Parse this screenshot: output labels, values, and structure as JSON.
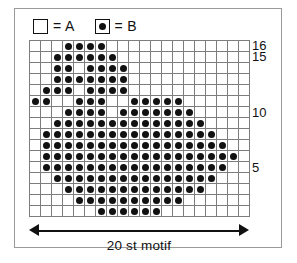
{
  "legend": {
    "items": [
      {
        "icon": "empty-square-swatch",
        "filled": false,
        "text": "= A"
      },
      {
        "icon": "dotted-square-swatch",
        "filled": true,
        "text": "= B"
      }
    ]
  },
  "chart_data": {
    "type": "heatmap",
    "title": "",
    "xlabel": "20 st motif",
    "ylabel": "",
    "columns": 20,
    "rows": 16,
    "grid_on": true,
    "legend_position": "top-left",
    "symbols": {
      "A": "empty",
      "B": "dot"
    },
    "row_tick_labels": [
      "16",
      "15",
      "10",
      "5"
    ],
    "row_tick_rows": [
      16,
      15,
      10,
      5
    ],
    "row_numbering": "bottom-to-top",
    "note": "rows listed top(16) to bottom(1); each row is 20 columns left-to-right, 0 = A (empty), 1 = B (dot)",
    "values": [
      [
        0,
        0,
        0,
        1,
        1,
        1,
        1,
        0,
        0,
        0,
        0,
        0,
        0,
        0,
        0,
        0,
        0,
        0,
        0,
        0
      ],
      [
        0,
        0,
        1,
        1,
        1,
        1,
        1,
        1,
        0,
        0,
        0,
        0,
        0,
        0,
        0,
        0,
        0,
        0,
        0,
        0
      ],
      [
        0,
        0,
        1,
        1,
        0,
        1,
        1,
        1,
        1,
        0,
        0,
        0,
        0,
        0,
        0,
        0,
        0,
        0,
        0,
        0
      ],
      [
        0,
        0,
        1,
        1,
        1,
        1,
        1,
        1,
        1,
        0,
        0,
        0,
        0,
        0,
        0,
        0,
        0,
        0,
        0,
        0
      ],
      [
        0,
        1,
        1,
        1,
        0,
        1,
        1,
        1,
        1,
        0,
        0,
        0,
        0,
        0,
        0,
        0,
        0,
        0,
        0,
        0
      ],
      [
        1,
        1,
        0,
        0,
        1,
        1,
        1,
        0,
        0,
        1,
        1,
        1,
        1,
        1,
        0,
        0,
        0,
        0,
        0,
        0
      ],
      [
        0,
        0,
        0,
        1,
        1,
        1,
        1,
        0,
        1,
        1,
        1,
        1,
        1,
        1,
        1,
        0,
        0,
        0,
        0,
        0
      ],
      [
        0,
        0,
        1,
        1,
        1,
        1,
        1,
        1,
        1,
        1,
        1,
        1,
        1,
        1,
        1,
        1,
        0,
        0,
        0,
        0
      ],
      [
        0,
        1,
        1,
        1,
        1,
        1,
        1,
        1,
        1,
        1,
        1,
        1,
        1,
        1,
        1,
        1,
        1,
        0,
        0,
        0
      ],
      [
        0,
        1,
        1,
        1,
        1,
        1,
        1,
        1,
        1,
        1,
        1,
        1,
        1,
        1,
        1,
        1,
        1,
        1,
        0,
        0
      ],
      [
        0,
        1,
        1,
        1,
        1,
        1,
        1,
        1,
        1,
        1,
        1,
        1,
        1,
        1,
        1,
        1,
        1,
        1,
        1,
        0
      ],
      [
        0,
        1,
        1,
        1,
        1,
        1,
        1,
        1,
        1,
        1,
        1,
        1,
        1,
        1,
        1,
        1,
        1,
        1,
        0,
        0
      ],
      [
        0,
        0,
        1,
        1,
        1,
        1,
        1,
        1,
        1,
        1,
        1,
        1,
        1,
        1,
        1,
        1,
        1,
        0,
        0,
        0
      ],
      [
        0,
        0,
        0,
        1,
        1,
        1,
        1,
        1,
        1,
        1,
        1,
        1,
        1,
        1,
        1,
        1,
        0,
        0,
        0,
        0
      ],
      [
        0,
        0,
        0,
        0,
        1,
        1,
        1,
        1,
        1,
        1,
        1,
        1,
        1,
        1,
        0,
        0,
        0,
        0,
        0,
        0
      ],
      [
        0,
        0,
        0,
        0,
        0,
        0,
        1,
        1,
        1,
        1,
        1,
        1,
        0,
        0,
        0,
        0,
        0,
        0,
        0,
        0
      ]
    ]
  },
  "measure": {
    "caption": "20 st motif",
    "left_arrow": "arrow-left-icon",
    "right_arrow": "arrow-right-icon"
  }
}
